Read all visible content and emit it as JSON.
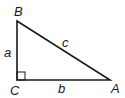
{
  "diagram": {
    "type": "right-triangle",
    "vertices": {
      "B": "B",
      "C": "C",
      "A": "A"
    },
    "sides": {
      "a": "a",
      "b": "b",
      "c": "c"
    },
    "right_angle_at": "C",
    "stroke_color": "#1a1a1a"
  }
}
